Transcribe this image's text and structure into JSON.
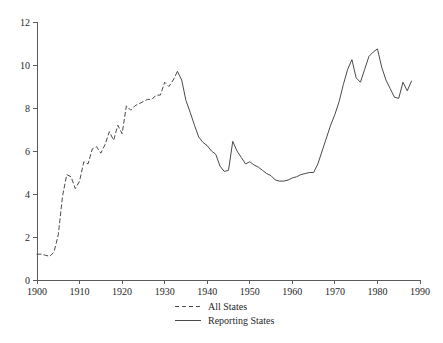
{
  "chart_data": {
    "type": "line",
    "title": "",
    "subtitle": "",
    "xlabel": "",
    "ylabel": "",
    "xlim": [
      1900,
      1990
    ],
    "ylim": [
      0,
      12
    ],
    "grid": false,
    "legend_position": "bottom-center",
    "x_ticks": [
      1900,
      1910,
      1920,
      1930,
      1940,
      1950,
      1960,
      1970,
      1980,
      1990
    ],
    "x_tick_labels": [
      "1900",
      "1910",
      "1920",
      "1930",
      "1940",
      "1950",
      "1960",
      "1970",
      "1980",
      "1990"
    ],
    "y_ticks": [
      0,
      2,
      4,
      6,
      8,
      10,
      12
    ],
    "y_tick_labels": [
      "0",
      "2",
      "4",
      "6",
      "8",
      "10",
      "12"
    ],
    "series": [
      {
        "name": "All States",
        "style": "dashed",
        "color": "#4a4a4a",
        "x": [
          1900,
          1901,
          1902,
          1903,
          1904,
          1905,
          1906,
          1907,
          1908,
          1909,
          1910,
          1911,
          1912,
          1913,
          1914,
          1915,
          1916,
          1917,
          1918,
          1919,
          1920,
          1921,
          1922,
          1923,
          1924,
          1925,
          1926,
          1927,
          1928,
          1929,
          1930,
          1931,
          1932,
          1933
        ],
        "values": [
          1.2,
          1.2,
          1.15,
          1.1,
          1.3,
          2.1,
          3.9,
          4.9,
          4.8,
          4.25,
          4.6,
          5.5,
          5.4,
          6.1,
          6.2,
          5.9,
          6.3,
          6.9,
          6.5,
          7.2,
          6.8,
          8.1,
          7.9,
          8.1,
          8.2,
          8.3,
          8.4,
          8.4,
          8.6,
          8.6,
          9.2,
          9.0,
          9.3,
          9.7
        ],
        "end_label_note": "dashed series covers 1900-1933"
      },
      {
        "name": "Reporting States",
        "style": "solid",
        "color": "#4a4a4a",
        "x": [
          1933,
          1934,
          1935,
          1936,
          1937,
          1938,
          1939,
          1940,
          1941,
          1942,
          1943,
          1944,
          1945,
          1946,
          1947,
          1948,
          1949,
          1950,
          1951,
          1952,
          1953,
          1954,
          1955,
          1956,
          1957,
          1958,
          1959,
          1960,
          1961,
          1962,
          1963,
          1964,
          1965,
          1966,
          1967,
          1968,
          1969,
          1970,
          1971,
          1972,
          1973,
          1974,
          1975,
          1976,
          1977,
          1978,
          1979,
          1980,
          1981,
          1982,
          1983,
          1984,
          1985,
          1986,
          1987,
          1988
        ],
        "values": [
          9.7,
          9.3,
          8.35,
          7.8,
          7.2,
          6.65,
          6.4,
          6.25,
          6.0,
          5.85,
          5.3,
          5.05,
          5.1,
          6.45,
          6.0,
          5.7,
          5.4,
          5.5,
          5.35,
          5.25,
          5.1,
          4.95,
          4.85,
          4.65,
          4.6,
          4.6,
          4.65,
          4.75,
          4.8,
          4.9,
          4.95,
          5.0,
          5.0,
          5.4,
          6.0,
          6.6,
          7.2,
          7.7,
          8.3,
          9.1,
          9.8,
          10.25,
          9.4,
          9.2,
          9.8,
          10.4,
          10.6,
          10.75,
          9.9,
          9.3,
          8.9,
          8.5,
          8.45,
          9.2,
          8.8,
          9.25
        ],
        "end_label_note": "solid series covers 1933-1988"
      }
    ],
    "legend": [
      {
        "label": "All States",
        "style": "dashed"
      },
      {
        "label": "Reporting States",
        "style": "solid"
      }
    ]
  },
  "axes": {
    "y_top_label": "12",
    "y_bottom_label": "0",
    "x_left_label": "1900",
    "x_right_label": "1990"
  }
}
